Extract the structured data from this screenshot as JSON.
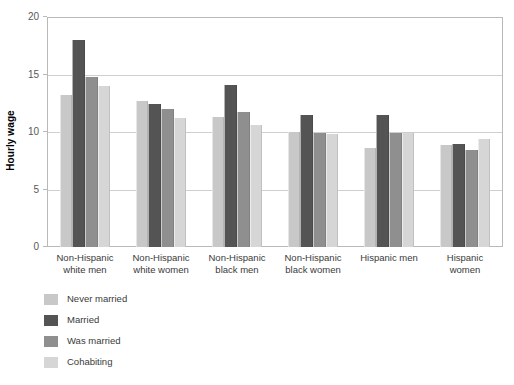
{
  "chart_data": {
    "type": "bar",
    "title": "",
    "xlabel": "",
    "ylabel": "Hourly wage",
    "ylim": [
      0,
      20
    ],
    "yticks": [
      0,
      5,
      10,
      15,
      20
    ],
    "grid": true,
    "legend_position": "below-left",
    "categories": [
      "Non-Hispanic white men",
      "Non-Hispanic white women",
      "Non-Hispanic black men",
      "Non-Hispanic black women",
      "Hispanic men",
      "Hispanic women"
    ],
    "category_lines": [
      [
        "Non-Hispanic",
        "white men"
      ],
      [
        "Non-Hispanic",
        "white women"
      ],
      [
        "Non-Hispanic",
        "black men"
      ],
      [
        "Non-Hispanic",
        "black women"
      ],
      [
        "Hispanic men",
        ""
      ],
      [
        "Hispanic",
        "women"
      ]
    ],
    "series": [
      {
        "name": "Never married",
        "color": "#c8c8c8",
        "values": [
          13.2,
          12.7,
          11.3,
          10.0,
          8.6,
          8.9
        ]
      },
      {
        "name": "Married",
        "color": "#545454",
        "values": [
          18.0,
          12.4,
          14.1,
          11.5,
          11.5,
          9.0
        ]
      },
      {
        "name": "Was married",
        "color": "#8f8f8f",
        "values": [
          14.8,
          12.0,
          11.7,
          9.9,
          9.9,
          8.4
        ]
      },
      {
        "name": "Cohabiting",
        "color": "#d6d6d6",
        "values": [
          14.0,
          11.2,
          10.6,
          9.8,
          9.9,
          9.4
        ]
      }
    ]
  }
}
